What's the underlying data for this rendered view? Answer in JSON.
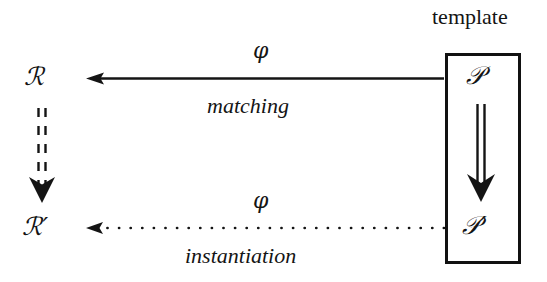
{
  "diagram": {
    "title_label": "template",
    "nodes": {
      "source_top": "ℛ",
      "source_bottom": "ℛ′",
      "pattern_top": "𝒫",
      "pattern_bottom": "𝒫′"
    },
    "edges": {
      "top_arrow": {
        "map_label": "φ",
        "name_label": "matching",
        "direction": "right-to-left",
        "style": "solid"
      },
      "bottom_arrow": {
        "map_label": "φ",
        "name_label": "instantiation",
        "direction": "right-to-left",
        "style": "dotted"
      },
      "left_arrow": {
        "direction": "top-to-bottom",
        "style": "dotted-double"
      },
      "right_arrow": {
        "direction": "top-to-bottom",
        "style": "solid-double"
      }
    },
    "colors": {
      "ink": "#141414",
      "background": "#ffffff"
    }
  }
}
